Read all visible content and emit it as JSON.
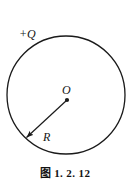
{
  "figure": {
    "caption": "图 1. 2. 12",
    "background_color": "#ffffff",
    "stroke_color": "#1a1a1a",
    "labels": {
      "charge": "+Q",
      "center": "O",
      "radius": "R"
    },
    "geometry": {
      "circle": {
        "center_x": 66,
        "center_y": 95,
        "radius": 59,
        "stroke_width": 1.3
      },
      "center_dot": {
        "x": 67,
        "y": 100,
        "radius": 2.1
      },
      "radius_arrow": {
        "from_x": 67,
        "from_y": 100,
        "to_x": 25,
        "to_y": 139,
        "stroke_width": 1.2,
        "arrowhead_length": 7,
        "arrowhead_width": 4.5
      }
    }
  }
}
